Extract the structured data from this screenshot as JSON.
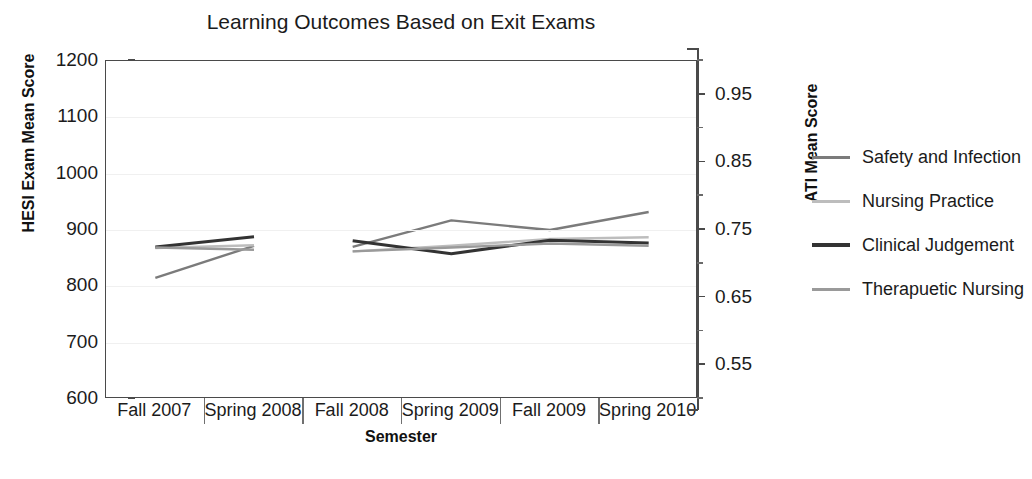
{
  "chart_data": {
    "type": "line",
    "title": "Learning Outcomes Based on Exit Exams",
    "xlabel": "Semester",
    "ylabel": "HESI Exam Mean Score",
    "y2label": "ATI Mean Score",
    "categories": [
      "Fall 2007",
      "Spring 2008",
      "Fall 2008",
      "Spring 2009",
      "Fall 2009",
      "Spring 2010"
    ],
    "ylim": [
      600,
      1200
    ],
    "yticks": [
      600,
      700,
      800,
      900,
      1000,
      1100,
      1200
    ],
    "y2lim": [
      0.5,
      1.0
    ],
    "y2ticks": [
      0.55,
      0.65,
      0.75,
      0.85,
      0.95
    ],
    "grid": true,
    "legend_position": "right",
    "gap_between": "Spring 2008 and Fall 2008",
    "series": [
      {
        "name": "Safety and Infection",
        "color": "#7b7b7b",
        "axis": "right",
        "values": [
          815,
          872,
          870,
          917,
          900,
          932
        ]
      },
      {
        "name": "Nursing Practice",
        "color": "#bdbdbd",
        "axis": "right",
        "values": [
          868,
          873,
          862,
          872,
          884,
          887
        ]
      },
      {
        "name": "Clinical Judgement",
        "color": "#333333",
        "axis": "right",
        "values": [
          870,
          888,
          881,
          858,
          882,
          877
        ]
      },
      {
        "name": "Therapuetic Nursing",
        "color": "#9a9a9a",
        "axis": "right",
        "values": [
          869,
          865,
          862,
          869,
          876,
          872
        ]
      }
    ]
  }
}
